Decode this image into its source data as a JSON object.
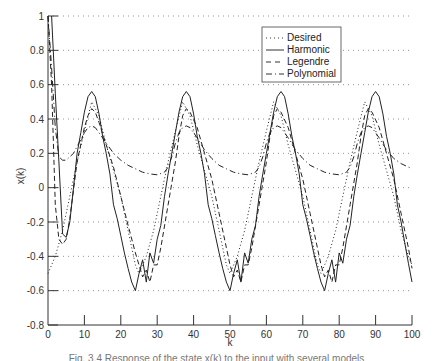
{
  "chart_data": {
    "type": "line",
    "title": "",
    "xlabel": "k",
    "ylabel": "x(k)",
    "xlim": [
      0,
      100
    ],
    "ylim": [
      -0.8,
      1
    ],
    "xticks": [
      0,
      10,
      20,
      30,
      40,
      50,
      60,
      70,
      80,
      90,
      100
    ],
    "yticks": [
      -0.8,
      -0.6,
      -0.4,
      -0.2,
      0,
      0.2,
      0.4,
      0.6,
      0.8,
      1
    ],
    "grid": "horizontal dotted",
    "legend_position": "upper right (inside)",
    "series": [
      {
        "name": "Desired",
        "style": "dotted",
        "x": [
          0,
          2,
          4,
          6,
          8,
          10,
          12,
          14,
          16,
          18,
          20,
          22,
          24,
          25,
          27,
          29,
          31,
          33,
          35,
          37,
          39,
          41,
          43,
          45,
          47,
          49,
          50,
          52,
          54,
          56,
          58,
          60,
          62,
          64,
          66,
          68,
          70,
          72,
          74,
          75,
          77,
          79,
          81,
          83,
          85,
          87,
          89,
          91,
          93,
          95,
          97,
          99,
          100
        ],
        "values": [
          -0.5,
          -0.4,
          -0.25,
          -0.05,
          0.15,
          0.33,
          0.5,
          0.42,
          0.25,
          0.1,
          -0.05,
          -0.25,
          -0.45,
          -0.5,
          -0.4,
          -0.25,
          -0.05,
          0.15,
          0.33,
          0.5,
          0.42,
          0.25,
          0.1,
          -0.05,
          -0.25,
          -0.45,
          -0.5,
          -0.4,
          -0.25,
          -0.05,
          0.15,
          0.33,
          0.5,
          0.42,
          0.25,
          0.1,
          -0.05,
          -0.25,
          -0.45,
          -0.5,
          -0.4,
          -0.25,
          -0.05,
          0.15,
          0.33,
          0.5,
          0.42,
          0.25,
          0.1,
          -0.05,
          -0.25,
          -0.4,
          -0.45
        ]
      },
      {
        "name": "Harmonic",
        "style": "solid",
        "x": [
          1,
          2,
          3,
          4,
          5,
          6,
          7,
          8,
          9,
          10,
          11,
          12,
          13,
          14,
          15,
          16,
          17,
          18,
          19,
          20,
          21,
          22,
          23,
          24,
          25,
          26,
          27,
          28,
          29,
          30,
          31,
          32,
          33,
          34,
          35,
          36,
          37,
          38,
          39,
          40,
          41,
          42,
          43,
          44,
          45,
          46,
          47,
          48,
          49,
          50,
          51,
          52,
          53,
          54,
          55,
          56,
          57,
          58,
          59,
          60,
          61,
          62,
          63,
          64,
          65,
          66,
          67,
          68,
          69,
          70,
          71,
          72,
          73,
          74,
          75,
          76,
          77,
          78,
          79,
          80,
          81,
          82,
          83,
          84,
          85,
          86,
          87,
          88,
          89,
          90,
          91,
          92,
          93,
          94,
          95,
          96,
          97,
          98,
          99,
          100
        ],
        "values": [
          1.0,
          0.55,
          0.15,
          -0.27,
          -0.29,
          -0.2,
          0.0,
          0.2,
          0.32,
          0.44,
          0.53,
          0.56,
          0.53,
          0.43,
          0.3,
          0.2,
          0.08,
          -0.1,
          -0.18,
          -0.28,
          -0.38,
          -0.47,
          -0.55,
          -0.6,
          -0.5,
          -0.42,
          -0.55,
          -0.38,
          -0.44,
          -0.3,
          -0.22,
          -0.05,
          0.08,
          0.2,
          0.32,
          0.44,
          0.53,
          0.56,
          0.53,
          0.43,
          0.3,
          0.2,
          0.08,
          -0.1,
          -0.18,
          -0.28,
          -0.38,
          -0.47,
          -0.55,
          -0.6,
          -0.5,
          -0.42,
          -0.55,
          -0.38,
          -0.44,
          -0.3,
          -0.22,
          -0.05,
          0.08,
          0.2,
          0.32,
          0.44,
          0.53,
          0.56,
          0.53,
          0.43,
          0.3,
          0.2,
          0.08,
          -0.1,
          -0.18,
          -0.28,
          -0.38,
          -0.47,
          -0.55,
          -0.6,
          -0.5,
          -0.42,
          -0.55,
          -0.38,
          -0.44,
          -0.3,
          -0.22,
          -0.05,
          0.08,
          0.2,
          0.32,
          0.44,
          0.53,
          0.56,
          0.53,
          0.43,
          0.3,
          0.2,
          0.08,
          -0.1,
          -0.2,
          -0.32,
          -0.44,
          -0.55
        ]
      },
      {
        "name": "Legendre",
        "style": "dashed",
        "x": [
          0,
          1,
          2,
          3,
          4,
          5,
          6,
          8,
          10,
          11,
          12,
          13,
          14,
          16,
          18,
          20,
          22,
          24,
          25,
          26,
          27,
          28,
          29,
          30,
          31,
          33,
          35,
          36,
          37,
          38,
          39,
          41,
          43,
          45,
          47,
          49,
          50,
          51,
          52,
          53,
          54,
          55,
          56,
          58,
          60,
          61,
          62,
          63,
          64,
          66,
          68,
          70,
          72,
          74,
          75,
          76,
          77,
          78,
          79,
          80,
          81,
          83,
          85,
          86,
          87,
          88,
          89,
          91,
          93,
          95,
          97,
          99,
          100
        ],
        "values": [
          1.0,
          0.6,
          -0.1,
          -0.3,
          -0.33,
          -0.3,
          -0.18,
          0.15,
          0.35,
          0.42,
          0.46,
          0.44,
          0.38,
          0.25,
          0.12,
          -0.05,
          -0.22,
          -0.38,
          -0.45,
          -0.52,
          -0.48,
          -0.55,
          -0.45,
          -0.45,
          -0.35,
          -0.1,
          0.15,
          0.3,
          0.42,
          0.46,
          0.44,
          0.35,
          0.2,
          0.05,
          -0.15,
          -0.35,
          -0.45,
          -0.52,
          -0.48,
          -0.55,
          -0.45,
          -0.45,
          -0.35,
          -0.1,
          0.15,
          0.3,
          0.42,
          0.46,
          0.44,
          0.35,
          0.2,
          0.05,
          -0.15,
          -0.35,
          -0.45,
          -0.52,
          -0.48,
          -0.55,
          -0.45,
          -0.45,
          -0.35,
          -0.1,
          0.15,
          0.3,
          0.42,
          0.46,
          0.44,
          0.35,
          0.2,
          0.05,
          -0.15,
          -0.35,
          -0.47
        ]
      },
      {
        "name": "Polynomial",
        "style": "dash-dot",
        "x": [
          0,
          1,
          2,
          3,
          4,
          5,
          6,
          7,
          8,
          9,
          10,
          11,
          12,
          13,
          14,
          16,
          18,
          20,
          22,
          24,
          26,
          28,
          30,
          32,
          33,
          34,
          35,
          36,
          37,
          38,
          39,
          41,
          43,
          45,
          47,
          49,
          51,
          53,
          55,
          57,
          58,
          59,
          60,
          61,
          62,
          63,
          64,
          66,
          68,
          70,
          72,
          74,
          76,
          78,
          80,
          82,
          83,
          84,
          85,
          86,
          87,
          88,
          89,
          91,
          93,
          95,
          97,
          99,
          100
        ],
        "values": [
          1.0,
          0.7,
          0.35,
          0.18,
          0.16,
          0.16,
          0.18,
          0.2,
          0.24,
          0.28,
          0.32,
          0.35,
          0.36,
          0.35,
          0.32,
          0.26,
          0.2,
          0.16,
          0.13,
          0.11,
          0.09,
          0.08,
          0.075,
          0.09,
          0.12,
          0.18,
          0.26,
          0.32,
          0.35,
          0.36,
          0.35,
          0.29,
          0.22,
          0.17,
          0.13,
          0.11,
          0.09,
          0.08,
          0.075,
          0.09,
          0.12,
          0.18,
          0.26,
          0.32,
          0.35,
          0.36,
          0.35,
          0.29,
          0.22,
          0.17,
          0.13,
          0.11,
          0.09,
          0.08,
          0.075,
          0.09,
          0.12,
          0.18,
          0.26,
          0.32,
          0.35,
          0.36,
          0.35,
          0.29,
          0.22,
          0.17,
          0.14,
          0.12,
          0.11
        ]
      }
    ]
  },
  "axes": {
    "xlabel": "k",
    "ylabel": "x(k)",
    "xtick_labels": [
      "0",
      "10",
      "20",
      "30",
      "40",
      "50",
      "60",
      "70",
      "80",
      "90",
      "100"
    ],
    "ytick_labels": [
      "-0.8",
      "-0.6",
      "-0.4",
      "-0.2",
      "0",
      "0.2",
      "0.4",
      "0.6",
      "0.8",
      "1"
    ]
  },
  "legend": {
    "items": [
      "Desired",
      "Harmonic",
      "Legendre",
      "Polynomial"
    ]
  },
  "caption": "Fig. 3.4  Response of the state x(k) to the input with several models"
}
